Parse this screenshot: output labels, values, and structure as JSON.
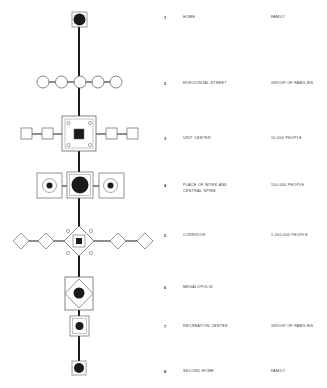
{
  "colors": {
    "line": "#1a1a1a",
    "outline": "#666666",
    "fill": "#1a1a1a",
    "background": "#ffffff"
  },
  "levels": [
    {
      "number": "1",
      "label": "HOME",
      "population": "FAMILY",
      "y": 17
    },
    {
      "number": "2",
      "label": "HORIZONTAL STREET",
      "population": "GROUP OF FAMILIES",
      "y": 82
    },
    {
      "number": "3",
      "label": "UNIT CENTER",
      "population": "10,000 PEOPLE",
      "y": 137
    },
    {
      "number": "4",
      "label": "PLACE OF WORK AND CENTRAL SPINE",
      "label_line1": "PLACE OF WORK AND",
      "label_line2": "CENTRAL SPINE",
      "population": "100,000 PEOPLE",
      "y": 184
    },
    {
      "number": "5",
      "label": "CORRIDOR",
      "population": "1,000,000 PEOPLE",
      "y": 233
    },
    {
      "number": "6",
      "label": "MEGALOPOLIS",
      "population": "",
      "y": 285
    },
    {
      "number": "7",
      "label": "RECREATION CENTER",
      "population": "GROUP OF FAMILIES",
      "y": 324
    },
    {
      "number": "8",
      "label": "SECOND HOME",
      "population": "FAMILY",
      "y": 370
    }
  ]
}
